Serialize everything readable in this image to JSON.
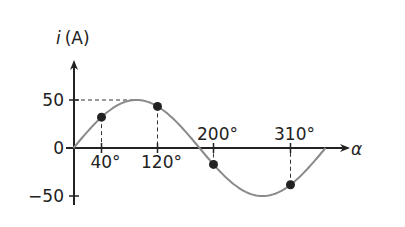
{
  "chart_data": {
    "type": "line",
    "title": "",
    "xlabel": "α",
    "ylabel": "i (A)",
    "ylabel_italic_part": "i",
    "ylabel_unit": "(A)",
    "y_ticks": [
      50,
      0,
      -50
    ],
    "y_tick_labels": [
      "50",
      "0",
      "−50"
    ],
    "ylim": [
      -50,
      50
    ],
    "xlim": [
      0,
      360
    ],
    "amplitude": 50,
    "series": [
      {
        "name": "i = 50·sin(α)",
        "function": "50*sin(alpha)",
        "x_range": [
          0,
          360
        ],
        "color": "#8a8a8a"
      }
    ],
    "marked_points": [
      {
        "x": 40,
        "y": 32.1,
        "label": "40°"
      },
      {
        "x": 120,
        "y": 43.3,
        "label": "120°"
      },
      {
        "x": 200,
        "y": -17.1,
        "label": "200°"
      },
      {
        "x": 310,
        "y": -38.3,
        "label": "310°"
      }
    ],
    "annotations": [
      "dashed line from y=50 to curve peak",
      "dashed drop lines from marked points to x-axis"
    ],
    "grid": false
  }
}
